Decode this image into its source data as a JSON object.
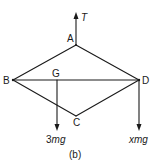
{
  "figure": {
    "caption": "(b)",
    "colors": {
      "ink": "#1a1a1a",
      "background": "#ffffff"
    },
    "points": {
      "A": {
        "label": "A",
        "x": 76,
        "y": 45
      },
      "B": {
        "label": "B",
        "x": 13,
        "y": 80
      },
      "C": {
        "label": "C",
        "x": 76,
        "y": 116
      },
      "D": {
        "label": "D",
        "x": 139,
        "y": 80
      },
      "G": {
        "label": "G",
        "x": 57,
        "y": 80
      }
    },
    "forces": {
      "tension": {
        "label": "T",
        "direction": "up",
        "from": "A"
      },
      "weight_G": {
        "label_num": "3",
        "label_var": "mg",
        "direction": "down",
        "from": "G"
      },
      "weight_D": {
        "label_num": "x",
        "label_var": "mg",
        "direction": "down",
        "from": "D"
      }
    },
    "edges": [
      "A-B",
      "A-D",
      "B-C",
      "C-D",
      "B-D"
    ]
  }
}
